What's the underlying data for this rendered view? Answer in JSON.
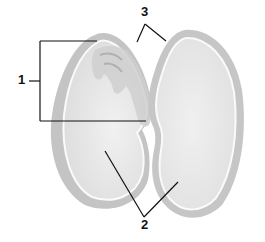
{
  "diagram": {
    "labels": [
      {
        "id": "1",
        "text": "1",
        "points_to": "embryo (bracketed region)"
      },
      {
        "id": "2",
        "text": "2",
        "points_to": "cotyledons (both halves)"
      },
      {
        "id": "3",
        "text": "3",
        "points_to": "seed coat edges"
      }
    ]
  },
  "colors": {
    "background": "#ffffff",
    "line": "#111111",
    "seed_fill": "#ececec",
    "seed_outer": "#bdbdbd",
    "seed_rim": "#f7f7f7",
    "embryo": "#c9c9c9"
  }
}
